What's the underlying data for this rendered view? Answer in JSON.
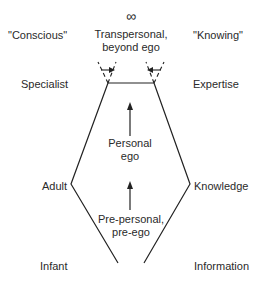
{
  "diagram": {
    "top_symbol": "∞",
    "columns": {
      "left_header": "\"Conscious\"",
      "right_header": "\"Knowing\""
    },
    "left_levels": [
      "Specialist",
      "Adult",
      "Infant"
    ],
    "right_levels": [
      "Expertise",
      "Knowledge",
      "Information"
    ],
    "center_labels": {
      "transpersonal": [
        "Transpersonal,",
        "beyond ego"
      ],
      "personal": [
        "Personal",
        "ego"
      ],
      "prepersonal": [
        "Pre-personal,",
        "pre-ego"
      ]
    },
    "line_color": "#222222"
  }
}
